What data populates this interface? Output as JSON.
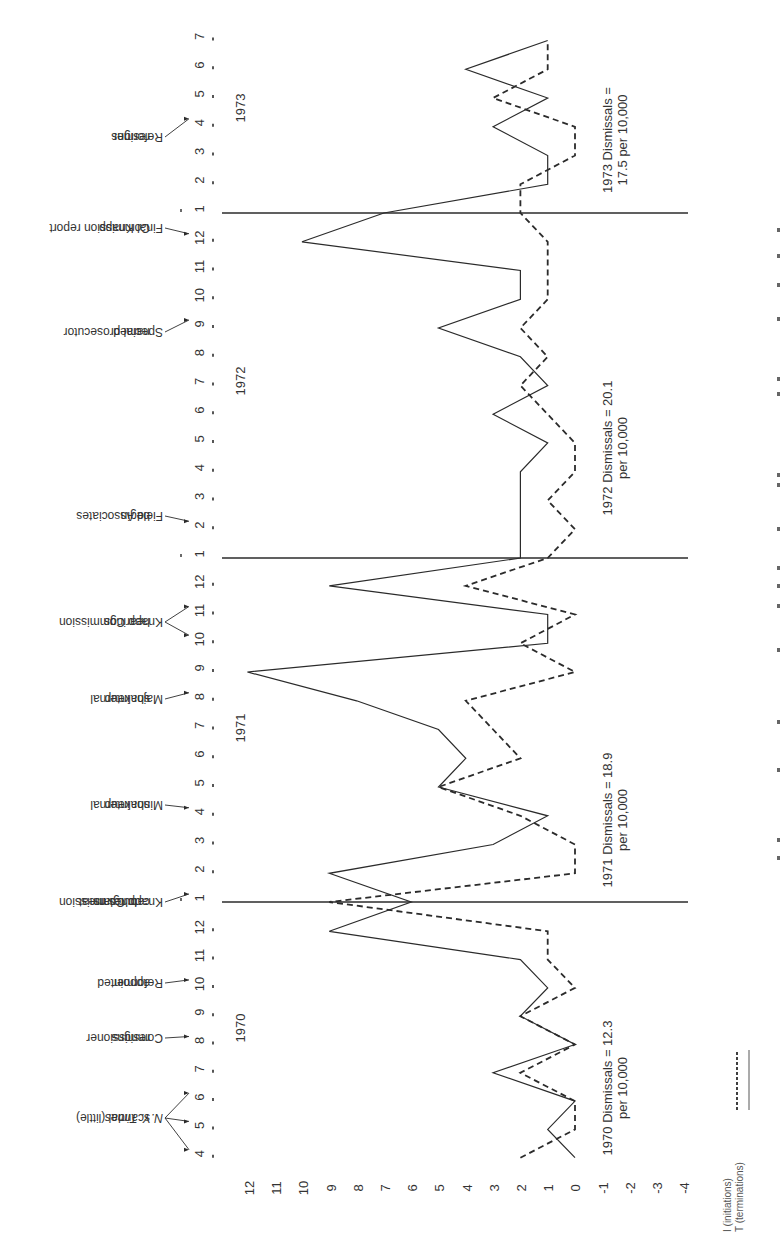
{
  "chart_data": {
    "type": "line",
    "orientation": "rotated-90-ccw",
    "title": "",
    "xlabel": "Month",
    "ylabel": "",
    "ylim": [
      -4,
      12
    ],
    "y_ticks": [
      12,
      11,
      10,
      9,
      8,
      7,
      6,
      5,
      4,
      3,
      2,
      1,
      0,
      -1,
      -2,
      -3,
      -4
    ],
    "years": [
      {
        "year": "1970",
        "months": [
          4,
          5,
          6,
          7,
          8,
          9,
          10,
          11,
          12
        ]
      },
      {
        "year": "1971",
        "months": [
          1,
          2,
          3,
          4,
          5,
          6,
          7,
          8,
          9,
          10,
          11,
          12
        ]
      },
      {
        "year": "1972",
        "months": [
          1,
          2,
          3,
          4,
          5,
          6,
          7,
          8,
          9,
          10,
          11,
          12
        ]
      },
      {
        "year": "1973",
        "months": [
          1,
          2,
          3,
          4,
          5,
          6,
          7
        ]
      }
    ],
    "x": [
      "1970-04",
      "1970-05",
      "1970-06",
      "1970-07",
      "1970-08",
      "1970-09",
      "1970-10",
      "1970-11",
      "1970-12",
      "1971-01",
      "1971-02",
      "1971-03",
      "1971-04",
      "1971-05",
      "1971-06",
      "1971-07",
      "1971-08",
      "1971-09",
      "1971-10",
      "1971-11",
      "1971-12",
      "1972-01",
      "1972-02",
      "1972-03",
      "1972-04",
      "1972-05",
      "1972-06",
      "1972-07",
      "1972-08",
      "1972-09",
      "1972-10",
      "1972-11",
      "1972-12",
      "1973-01",
      "1973-02",
      "1973-03",
      "1973-04",
      "1973-05",
      "1973-06",
      "1973-07"
    ],
    "series": [
      {
        "name": "I (initiations)",
        "style": "dashed",
        "values": [
          2,
          0,
          0,
          2,
          0,
          2,
          0,
          1,
          1,
          9,
          0,
          0,
          2,
          5,
          2,
          3,
          4,
          0,
          2,
          0,
          4,
          1,
          0,
          1,
          0,
          0,
          1,
          2,
          1,
          2,
          1,
          1,
          1,
          2,
          2,
          0,
          0,
          3,
          1,
          1
        ]
      },
      {
        "name": "T (terminations)",
        "style": "solid",
        "values": [
          0,
          1,
          0,
          3,
          0,
          2,
          1,
          2,
          9,
          6,
          9,
          3,
          1,
          5,
          4,
          5,
          8,
          12,
          1,
          1,
          9,
          2,
          2,
          2,
          2,
          1,
          3,
          1,
          2,
          5,
          2,
          2,
          10,
          7,
          1,
          1,
          3,
          1,
          4,
          1
        ]
      }
    ],
    "year_dividers": [
      "1971-01",
      "1972-01",
      "1973-01"
    ],
    "events": [
      {
        "label": "N.Y. Times scandal (little)",
        "months": [
          "1970-04",
          "1970-05",
          "1970-06"
        ]
      },
      {
        "label": "Commissioner resigns",
        "months": [
          "1970-08"
        ]
      },
      {
        "label": "Reformer appointed",
        "months": [
          "1970-10"
        ]
      },
      {
        "label": "Knapp Commission catches meat burglars",
        "months": [
          "1971-01"
        ]
      },
      {
        "label": "Minor internal shakeup",
        "months": [
          "1971-04"
        ]
      },
      {
        "label": "Major internal shakeup",
        "months": [
          "1971-08"
        ]
      },
      {
        "label": "Knapp Commission hearings",
        "months": [
          "1971-10",
          "1971-11"
        ]
      },
      {
        "label": "Field Associates begin",
        "months": [
          "1972-02"
        ]
      },
      {
        "label": "Special prosecutor named",
        "months": [
          "1972-09"
        ]
      },
      {
        "label": "Final Knapp Commission report",
        "months": [
          "1972-12"
        ]
      },
      {
        "label": "Reformer resigns",
        "months": [
          "1973-04"
        ]
      }
    ],
    "annotations": [
      {
        "year": "1970",
        "line1": "1970 Dismissals = 12.3",
        "line2": "per 10,000"
      },
      {
        "year": "1971",
        "line1": "1971  Dismissals = 18.9",
        "line2": "per 10,000"
      },
      {
        "year": "1972",
        "line1": "1972 Dismissals = 20.1",
        "line2": "per 10,000"
      },
      {
        "year": "1973",
        "line1": "1973 Dismissals =",
        "line2": "17.5 per 10,000"
      }
    ],
    "legend": [
      {
        "label": "I (initiations)",
        "style": "dashed"
      },
      {
        "label": "T (terminations)",
        "style": "solid"
      }
    ],
    "grid": false
  },
  "colors": {
    "line": "#2b2b2b",
    "text": "#333333",
    "background": "#ffffff"
  }
}
